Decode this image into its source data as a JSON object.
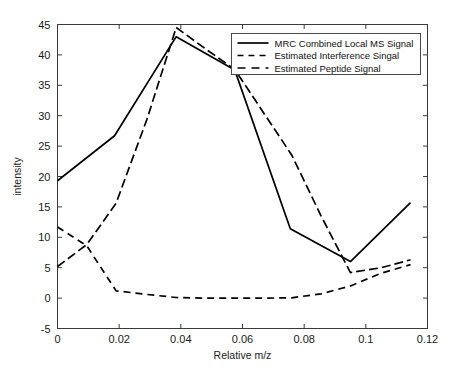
{
  "chart_data": {
    "type": "line",
    "title": "",
    "xlabel": "Relative m/z",
    "ylabel": "intensity",
    "xlim": [
      0,
      0.12
    ],
    "ylim": [
      -5,
      45
    ],
    "xticks": [
      0,
      0.02,
      0.04,
      0.06,
      0.08,
      0.1,
      0.12
    ],
    "xtick_labels": [
      "0",
      "0.02",
      "0.04",
      "0.06",
      "0.08",
      "0.1",
      "0.12"
    ],
    "yticks": [
      -5,
      0,
      5,
      10,
      15,
      20,
      25,
      30,
      35,
      40,
      45
    ],
    "ytick_labels": [
      "-5",
      "0",
      "5",
      "10",
      "15",
      "20",
      "25",
      "30",
      "35",
      "40",
      "45"
    ],
    "grid": false,
    "legend_position": "upper right",
    "series": [
      {
        "name": "MRC Combined Local MS Signal",
        "style": "solid",
        "color": "#000000",
        "x": [
          0,
          0.0185,
          0.0385,
          0.0575,
          0.0755,
          0.095,
          0.1145
        ],
        "values": [
          19.3,
          26.7,
          43.0,
          37.5,
          11.4,
          6.0,
          15.7
        ]
      },
      {
        "name": "Estimated Interference Singal",
        "style": "dashed",
        "color": "#000000",
        "x": [
          0,
          0.0095,
          0.019,
          0.029,
          0.0385,
          0.048,
          0.0575,
          0.067,
          0.076,
          0.0855,
          0.095,
          0.105,
          0.1145
        ],
        "values": [
          11.7,
          8.6,
          1.2,
          0.6,
          0.1,
          0.0,
          0.0,
          0.0,
          0.05,
          0.7,
          2.0,
          4.1,
          5.5
        ]
      },
      {
        "name": "Estimated Peptide Signal",
        "style": "dashdot",
        "color": "#000000",
        "x": [
          0,
          0.0095,
          0.019,
          0.029,
          0.0385,
          0.048,
          0.0575,
          0.076,
          0.0855,
          0.095,
          0.105,
          0.1145
        ],
        "values": [
          5.2,
          8.8,
          15.6,
          29.4,
          44.5,
          41.0,
          37.6,
          23.5,
          13.5,
          4.2,
          5.0,
          6.3
        ]
      }
    ]
  },
  "legend": {
    "entries": [
      {
        "label": "MRC Combined Local MS Signal",
        "style": "solid"
      },
      {
        "label": "Estimated Interference Singal",
        "style": "dashed"
      },
      {
        "label": "Estimated Peptide Signal",
        "style": "dashdot"
      }
    ]
  },
  "axes": {
    "x_title": "Relative m/z",
    "y_title": "intensity"
  }
}
